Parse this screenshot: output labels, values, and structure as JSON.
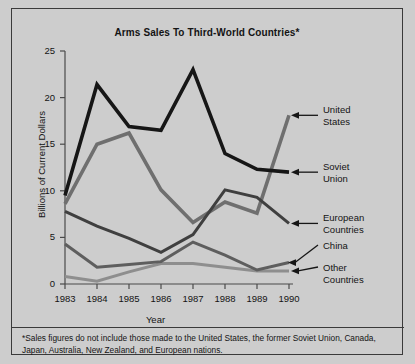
{
  "figure": {
    "title": "Arms Sales To Third-World Countries*",
    "footnote": "*Sales figures do not include those made to the United States, the former Soviet Union, Canada, Japan, Australia, New Zealand, and European nations.",
    "background_color": "#cdcdcd",
    "border_color": "#3a3a3a"
  },
  "axes": {
    "ylabel": "Billions of Current Dollars",
    "xlabel": "Year",
    "yticks": [
      "0",
      "5",
      "10",
      "15",
      "20",
      "25"
    ],
    "xticks": [
      "1983",
      "1984",
      "1985",
      "1986",
      "1987",
      "1988",
      "1989",
      "1990"
    ]
  },
  "labels": {
    "united_states": "United\nStates",
    "soviet_union": "Soviet\nUnion",
    "european_countries": "European\nCountries",
    "china": "China",
    "other_countries": "Other\nCountries"
  },
  "chart_data": {
    "type": "line",
    "title": "Arms Sales To Third-World Countries*",
    "xlabel": "Year",
    "ylabel": "Billions of Current Dollars",
    "x": [
      1983,
      1984,
      1985,
      1986,
      1987,
      1988,
      1989,
      1990
    ],
    "xlim": [
      1983,
      1990
    ],
    "ylim": [
      0,
      25
    ],
    "ytick_step": 5,
    "grid": false,
    "legend": "right-side callout labels with arrows",
    "series": [
      {
        "name": "Soviet Union",
        "color": "#161616",
        "width": 3.6,
        "values": [
          9.5,
          21.4,
          16.9,
          16.5,
          23.0,
          14.0,
          12.3,
          12.0
        ]
      },
      {
        "name": "United States",
        "color": "#6f6f6f",
        "width": 3.6,
        "values": [
          8.6,
          15.0,
          16.2,
          10.1,
          6.6,
          8.8,
          7.6,
          18.1
        ]
      },
      {
        "name": "European Countries",
        "color": "#3f3f3f",
        "width": 3.0,
        "values": [
          7.8,
          6.2,
          4.9,
          3.4,
          5.3,
          10.1,
          9.3,
          6.5
        ]
      },
      {
        "name": "China",
        "color": "#5e5e5e",
        "width": 3.0,
        "values": [
          4.3,
          1.8,
          2.1,
          2.4,
          4.5,
          3.1,
          1.5,
          2.3
        ]
      },
      {
        "name": "Other Countries",
        "color": "#8e8e8e",
        "width": 3.0,
        "values": [
          0.8,
          0.3,
          1.3,
          2.2,
          2.2,
          1.8,
          1.4,
          1.4
        ]
      }
    ]
  }
}
